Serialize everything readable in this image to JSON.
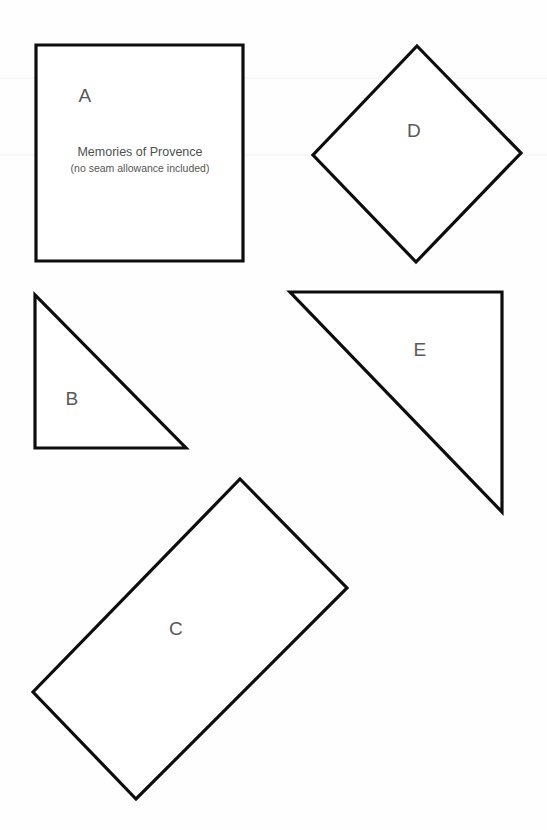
{
  "document": {
    "title": "Memories of Provence",
    "background_color": "#fefefe",
    "stroke_color": "#0d0d0d",
    "label_color": "#585858",
    "width": 547,
    "height": 830
  },
  "caption": {
    "line1": "Memories of Provence",
    "line2": "(no seam allowance included)"
  },
  "pieces": [
    {
      "id": "A",
      "label": "A",
      "shape": "square",
      "label_x": 85,
      "label_y": 95,
      "points": "36,45 243,45 243,261 36,261"
    },
    {
      "id": "B",
      "label": "B",
      "shape": "right-triangle",
      "label_x": 72,
      "label_y": 398,
      "points": "35,295 35,448 186,448"
    },
    {
      "id": "C",
      "label": "C",
      "shape": "rotated-rectangle",
      "label_x": 176,
      "label_y": 628,
      "points": "240,479 347,588 136,799 33,692"
    },
    {
      "id": "D",
      "label": "D",
      "shape": "diamond",
      "label_x": 414,
      "label_y": 130,
      "points": "417,46 521,153 416,262 313,155"
    },
    {
      "id": "E",
      "label": "E",
      "shape": "right-triangle",
      "label_x": 420,
      "label_y": 349,
      "points": "290,292 502,292 502,512"
    }
  ],
  "seam_lines": [
    {
      "y": 78
    },
    {
      "y": 155
    }
  ]
}
